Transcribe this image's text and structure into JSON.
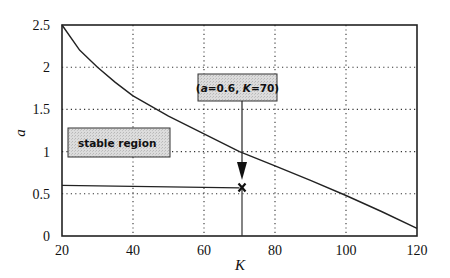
{
  "chart_data": {
    "type": "line",
    "title": "",
    "xlabel": "K",
    "ylabel": "a",
    "xlim": [
      20,
      120
    ],
    "ylim": [
      0,
      2.5
    ],
    "x_ticks": [
      "20",
      "40",
      "60",
      "80",
      "100",
      "120"
    ],
    "y_ticks": [
      "0",
      "0.5",
      "1",
      "1.5",
      "2",
      "2.5"
    ],
    "grid": "dotted",
    "legend": null,
    "series": [
      {
        "name": "stability boundary",
        "x": [
          20,
          25,
          30,
          35,
          40,
          50,
          60,
          70,
          80,
          90,
          100,
          110,
          120
        ],
        "y": [
          2.5,
          2.2,
          2.0,
          1.82,
          1.66,
          1.42,
          1.21,
          1.0,
          0.83,
          0.66,
          0.48,
          0.29,
          0.09
        ]
      },
      {
        "name": "operating line",
        "x": [
          20,
          70
        ],
        "y": [
          0.6,
          0.57
        ]
      }
    ],
    "annotations": [
      {
        "type": "label-box",
        "text": "stable region",
        "x": 21.5,
        "y": 0.95
      },
      {
        "type": "callout",
        "text": "(a=0.6, K=70)",
        "arrow_from": [
          70,
          1.0
        ],
        "arrow_to": [
          70,
          0.6
        ]
      },
      {
        "type": "marker",
        "symbol": "x",
        "x": 70,
        "y": 0.57
      },
      {
        "type": "vline",
        "x": 70,
        "y_from": 0,
        "y_to": 0.57
      }
    ]
  },
  "labels": {
    "stable_region": "stable region",
    "callout_a": "a",
    "callout_eq1": "=0.6, ",
    "callout_k": "K",
    "callout_eq2": "=70)",
    "callout_open": "(",
    "xlabel": "K",
    "ylabel": "a"
  }
}
